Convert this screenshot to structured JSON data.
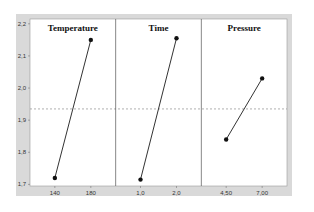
{
  "chart_data": {
    "type": "line",
    "title": "",
    "ylabel": "",
    "ylim": [
      1.695,
      2.215
    ],
    "yticks": [
      "1,7",
      "1,8",
      "1,9",
      "2,0",
      "2,1",
      "2,2"
    ],
    "ytick_values": [
      1.7,
      1.8,
      1.9,
      2.0,
      2.1,
      2.2
    ],
    "mean_line": 1.935,
    "grid": false,
    "panels": [
      {
        "name": "Temperature",
        "x": [
          "140",
          "180"
        ],
        "values": [
          1.72,
          2.15
        ]
      },
      {
        "name": "Time",
        "x": [
          "1,0",
          "2,0"
        ],
        "values": [
          1.715,
          2.155
        ]
      },
      {
        "name": "Pressure",
        "x": [
          "4,50",
          "7,00"
        ],
        "values": [
          1.84,
          2.03
        ]
      }
    ]
  },
  "colors": {
    "frame_bg": "#d9d9d9",
    "plot_bg": "#ffffff",
    "line": "#333333",
    "mean_line": "#8c8c8c"
  }
}
